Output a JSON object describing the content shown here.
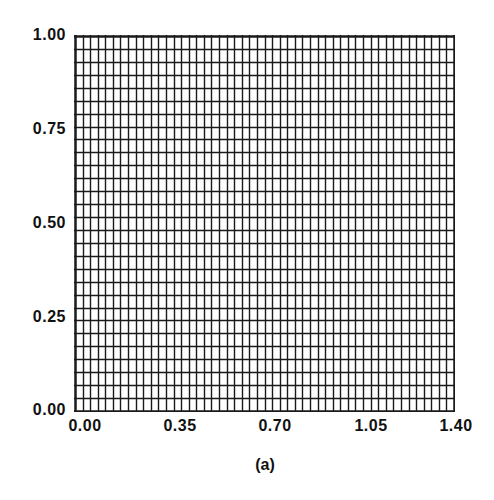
{
  "chart_data": {
    "type": "grid-mesh",
    "title": "",
    "caption": "(a)",
    "xlabel": "",
    "ylabel": "",
    "xlim": [
      0.0,
      1.4
    ],
    "ylim": [
      0.0,
      1.0
    ],
    "x_ticks": [
      "0.00",
      "0.35",
      "0.70",
      "1.05",
      "1.40"
    ],
    "y_ticks": [
      "0.00",
      "0.25",
      "0.50",
      "0.75",
      "1.00"
    ],
    "mesh": {
      "columns": 50,
      "rows": 29,
      "uniform": true,
      "line_color": "#1a1a1a"
    },
    "grid": true,
    "legend": null
  }
}
